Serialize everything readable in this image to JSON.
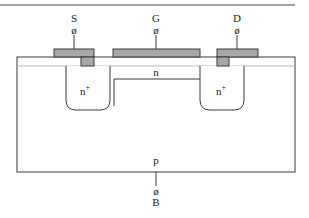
{
  "diagram": {
    "terminals": {
      "source": {
        "label": "S",
        "symbol": "ø"
      },
      "gate": {
        "label": "G",
        "symbol": "ø"
      },
      "drain": {
        "label": "D",
        "symbol": "ø"
      },
      "body": {
        "label": "B",
        "symbol": "ø"
      }
    },
    "regions": {
      "source_region": "n",
      "source_sup": "+",
      "drain_region": "n",
      "drain_sup": "+",
      "channel": "n",
      "substrate": "p"
    },
    "colors": {
      "metal": "#a8a8a8",
      "oxide": "#ffffff",
      "line": "#3a3a3a"
    }
  }
}
